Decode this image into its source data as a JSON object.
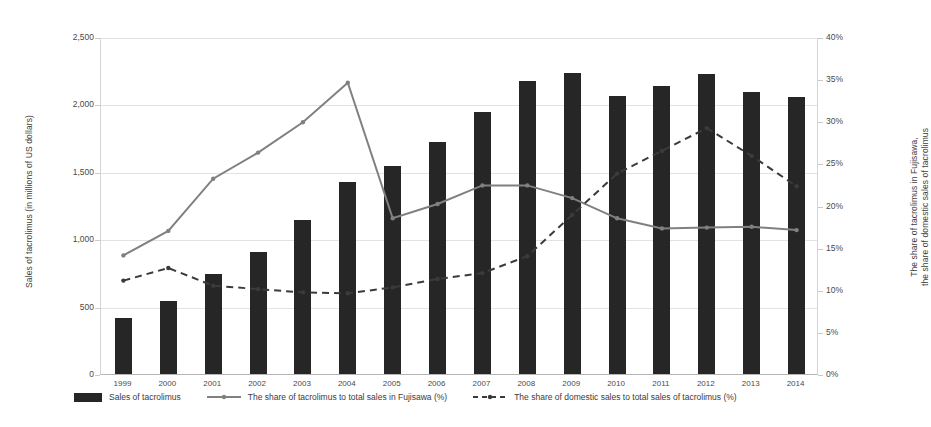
{
  "chart_data": {
    "type": "bar",
    "title": "",
    "categories": [
      "1999",
      "2000",
      "2001",
      "2002",
      "2003",
      "2004",
      "2005",
      "2006",
      "2007",
      "2008",
      "2009",
      "2010",
      "2011",
      "2012",
      "2013",
      "2014"
    ],
    "xlabel": "",
    "ylabel": "Sales of tacrolimus (in millions of US dollars)",
    "y2label_line1": "The share of tacrolimus in Fujisawa,",
    "y2label_line2": "the share of domestic sales of tacrolimus",
    "ylim": [
      0,
      2500
    ],
    "y2lim": [
      0,
      40
    ],
    "yticks": [
      "0",
      "500",
      "1,000",
      "1,500",
      "2,000",
      "2,500"
    ],
    "ytick_values": [
      0,
      500,
      1000,
      1500,
      2000,
      2500
    ],
    "y2ticks": [
      "0%",
      "5%",
      "10%",
      "15%",
      "20%",
      "25%",
      "30%",
      "35%",
      "40%"
    ],
    "y2tick_values": [
      0,
      5,
      10,
      15,
      20,
      25,
      30,
      35,
      40
    ],
    "grid": true,
    "legend_position": "bottom",
    "series": [
      {
        "name": "Sales of tacrolimus",
        "type": "bar",
        "axis": "left",
        "color": "#262626",
        "values": [
          415,
          545,
          745,
          905,
          1145,
          1425,
          1545,
          1720,
          1945,
          2175,
          2230,
          2060,
          2140,
          2225,
          2090,
          2055
        ]
      },
      {
        "name": "The share of tacrolimus to total sales in Fujisawa (%)",
        "type": "line",
        "axis": "right",
        "style": "solid",
        "color": "#808080",
        "values": [
          14.2,
          17.1,
          23.3,
          26.4,
          30.0,
          34.7,
          18.6,
          20.3,
          22.5,
          22.5,
          21.0,
          18.6,
          17.4,
          17.5,
          17.6,
          17.2
        ]
      },
      {
        "name": "The share of domestic sales to total sales of tacrolimus (%)",
        "type": "line",
        "axis": "right",
        "style": "dashed",
        "color": "#3b3b3b",
        "values": [
          11.2,
          12.7,
          10.6,
          10.2,
          9.8,
          9.7,
          10.4,
          11.4,
          12.1,
          14.1,
          19.0,
          23.9,
          26.6,
          29.3,
          26.0,
          22.4
        ]
      }
    ]
  },
  "legend": {
    "items": [
      {
        "label": "Sales of tacrolimus",
        "marker": "bar-swatch"
      },
      {
        "label": "The share of tacrolimus to total sales in Fujisawa (%)",
        "marker": "solid-line-marker"
      },
      {
        "label": "The share of domestic sales to total sales of tacrolimus (%)",
        "marker": "dashed-line-marker"
      }
    ]
  }
}
